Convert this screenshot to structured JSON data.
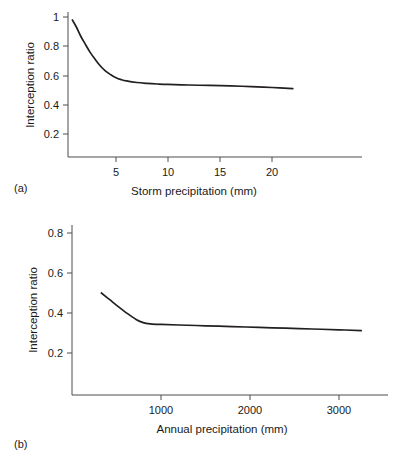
{
  "figure": {
    "background": "#ffffff",
    "line_color": "#231f20",
    "axis_color": "#4d4d4d"
  },
  "panels": [
    {
      "label": "(a)",
      "name": "panel-a"
    },
    {
      "label": "(b)",
      "name": "panel-b"
    }
  ],
  "chart_data": [
    {
      "type": "line",
      "title": "",
      "xlabel": "Storm precipitation (mm)",
      "ylabel": "Interception ratio",
      "xlim": [
        0,
        25
      ],
      "ylim": [
        0,
        1.07
      ],
      "xticks": [
        5,
        10,
        15,
        20
      ],
      "xtick_labels": [
        "5",
        "10",
        "15",
        "20"
      ],
      "yticks": [
        0.2,
        0.4,
        0.6,
        0.8,
        1
      ],
      "ytick_labels": [
        "0.2",
        "0.4",
        "0.6",
        "0.8",
        "1"
      ],
      "grid": false,
      "legend": "none",
      "series": [
        {
          "name": "Interception ratio vs storm precipitation",
          "x": [
            0.8,
            1.2,
            1.6,
            2.0,
            2.5,
            3.0,
            3.5,
            4.0,
            4.5,
            5.0,
            5.5,
            6.0,
            7.0,
            8.0,
            9.0,
            10.0,
            12.0,
            14.0,
            16.0,
            18.0,
            20.0,
            22.0
          ],
          "y": [
            0.98,
            0.93,
            0.87,
            0.82,
            0.76,
            0.71,
            0.665,
            0.63,
            0.605,
            0.585,
            0.572,
            0.563,
            0.552,
            0.546,
            0.542,
            0.539,
            0.535,
            0.532,
            0.529,
            0.524,
            0.518,
            0.51
          ]
        }
      ]
    },
    {
      "type": "line",
      "title": "",
      "xlabel": "Annual precipitation (mm)",
      "ylabel": "Interception ratio",
      "xlim": [
        0,
        3550
      ],
      "ylim": [
        0,
        0.86
      ],
      "xticks": [
        1000,
        2000,
        3000
      ],
      "xtick_labels": [
        "1000",
        "2000",
        "3000"
      ],
      "yticks": [
        0.2,
        0.4,
        0.6,
        0.8
      ],
      "ytick_labels": [
        "0.2",
        "0.4",
        "0.6",
        "0.8"
      ],
      "grid": false,
      "legend": "none",
      "series": [
        {
          "name": "Interception ratio vs annual precipitation",
          "x": [
            330,
            420,
            520,
            620,
            720,
            800,
            880,
            1000,
            1200,
            1500,
            1800,
            2100,
            2400,
            2700,
            3000,
            3250
          ],
          "y": [
            0.5,
            0.468,
            0.432,
            0.398,
            0.368,
            0.352,
            0.346,
            0.343,
            0.34,
            0.336,
            0.332,
            0.328,
            0.324,
            0.32,
            0.316,
            0.312
          ]
        }
      ]
    }
  ]
}
